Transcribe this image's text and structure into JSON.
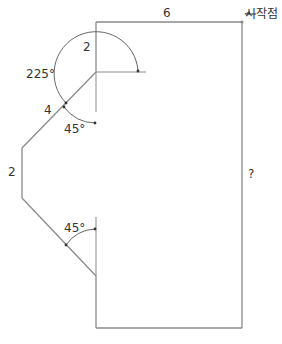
{
  "diagram": {
    "colors": {
      "line": "#8a8a8a",
      "text": "#333333",
      "background": "#ffffff"
    },
    "labels": {
      "top_length": "6",
      "start_point": "시작점",
      "right_length": "?",
      "inner_vertical_length": "2",
      "turn_angle": "225°",
      "diagonal_length": "4",
      "upper_angle": "45°",
      "left_length": "2",
      "lower_angle": "45°"
    },
    "icons": {
      "start_arrow": "arrow-left-icon"
    }
  }
}
